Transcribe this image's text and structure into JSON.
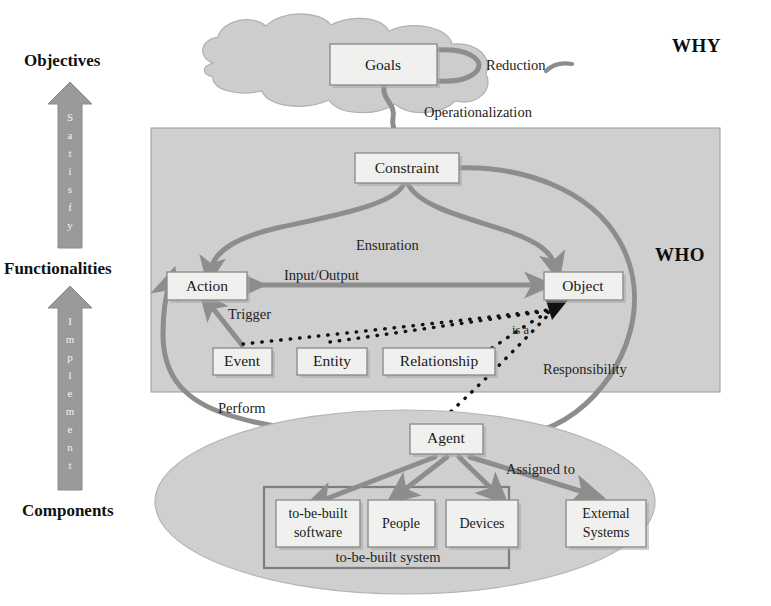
{
  "left_axis": {
    "labels": [
      {
        "id": "objectives",
        "text": "Objectives"
      },
      {
        "id": "functionalities",
        "text": "Functionalities"
      },
      {
        "id": "components",
        "text": "Components"
      }
    ],
    "arrows": [
      {
        "id": "satisfy",
        "text": "Satisfy",
        "letters": [
          "S",
          "a",
          "t",
          "i",
          "s",
          "f",
          "y"
        ]
      },
      {
        "id": "implement",
        "text": "Implement",
        "letters": [
          "I",
          "m",
          "p",
          "l",
          "e",
          "m",
          "e",
          "n",
          "t"
        ]
      }
    ]
  },
  "zones": [
    {
      "id": "why",
      "label": "WHY",
      "shape": "cloud"
    },
    {
      "id": "what",
      "label": "WHAT",
      "shape": "rectangle"
    },
    {
      "id": "who",
      "label": "WHO",
      "shape": "ellipse"
    }
  ],
  "nodes": {
    "goals": "Goals",
    "constraint": "Constraint",
    "action": "Action",
    "object": "Object",
    "event": "Event",
    "entity": "Entity",
    "relationship": "Relationship",
    "agent": "Agent",
    "to_be_built_software_line1": "to-be-built",
    "to_be_built_software_line2": "software",
    "people": "People",
    "devices": "Devices",
    "external_systems_line1": "External",
    "external_systems_line2": "Systems",
    "to_be_built_system": "to-be-built system"
  },
  "edges": {
    "reduction": "Reduction",
    "operationalization": "Operationalization",
    "ensuration": "Ensuration",
    "input_output": "Input/Output",
    "trigger": "Trigger",
    "is_a": "is a",
    "responsibility": "Responsibility",
    "perform": "Perform",
    "assigned_to": "Assigned to"
  },
  "colors": {
    "zone_fill": "#cfcfcf",
    "node_fill": "#f0f0ee",
    "node_stroke": "#8e8e8e",
    "link": "#8d8d8d",
    "dotted_link": "#111111",
    "text": "#1a1a1a"
  }
}
